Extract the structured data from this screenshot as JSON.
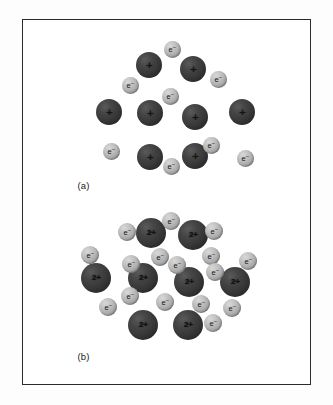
{
  "figure": {
    "background_color": "#fdfdfd",
    "frame_color": "#2b2b2b",
    "ion_color": "#383838",
    "electron_color": "#ababab",
    "panels": [
      {
        "id": "panel-a",
        "label": "(a)",
        "label_x": 78,
        "label_y": 181,
        "caption_meaning": "Metal lattice of singly charged positive ions in a sea of delocalised electrons",
        "ion_charge": "+",
        "ion_radius": 13,
        "electron_radius": 8.5,
        "electron_label": "e",
        "electron_superscript": "−",
        "ions": [
          {
            "x": 150,
            "y": 66
          },
          {
            "x": 194,
            "y": 70
          },
          {
            "x": 110,
            "y": 113
          },
          {
            "x": 151,
            "y": 114
          },
          {
            "x": 196,
            "y": 118
          },
          {
            "x": 243,
            "y": 113
          },
          {
            "x": 151,
            "y": 158
          },
          {
            "x": 196,
            "y": 157
          }
        ],
        "electrons": [
          {
            "x": 173,
            "y": 50
          },
          {
            "x": 131,
            "y": 86
          },
          {
            "x": 219,
            "y": 80
          },
          {
            "x": 171,
            "y": 97
          },
          {
            "x": 112,
            "y": 152
          },
          {
            "x": 172,
            "y": 167
          },
          {
            "x": 212,
            "y": 146
          },
          {
            "x": 246,
            "y": 159
          }
        ]
      },
      {
        "id": "panel-b",
        "label": "(b)",
        "label_x": 78,
        "label_y": 352,
        "caption_meaning": "Metal lattice of doubly charged positive ions in a denser sea of delocalised electrons",
        "ion_charge": "2+",
        "ion_radius": 15,
        "electron_radius": 9,
        "electron_label": "e",
        "electron_superscript": "−",
        "ions": [
          {
            "x": 152,
            "y": 234
          },
          {
            "x": 194,
            "y": 236
          },
          {
            "x": 97,
            "y": 279
          },
          {
            "x": 144,
            "y": 279
          },
          {
            "x": 190,
            "y": 283
          },
          {
            "x": 236,
            "y": 283
          },
          {
            "x": 144,
            "y": 326
          },
          {
            "x": 189,
            "y": 326
          }
        ],
        "electrons": [
          {
            "x": 128,
            "y": 233
          },
          {
            "x": 172,
            "y": 222
          },
          {
            "x": 215,
            "y": 232
          },
          {
            "x": 91,
            "y": 256
          },
          {
            "x": 132,
            "y": 265
          },
          {
            "x": 161,
            "y": 258
          },
          {
            "x": 178,
            "y": 266
          },
          {
            "x": 212,
            "y": 257
          },
          {
            "x": 249,
            "y": 262
          },
          {
            "x": 216,
            "y": 273
          },
          {
            "x": 131,
            "y": 297
          },
          {
            "x": 109,
            "y": 308
          },
          {
            "x": 166,
            "y": 303
          },
          {
            "x": 202,
            "y": 305
          },
          {
            "x": 233,
            "y": 309
          },
          {
            "x": 214,
            "y": 324
          }
        ]
      }
    ]
  }
}
